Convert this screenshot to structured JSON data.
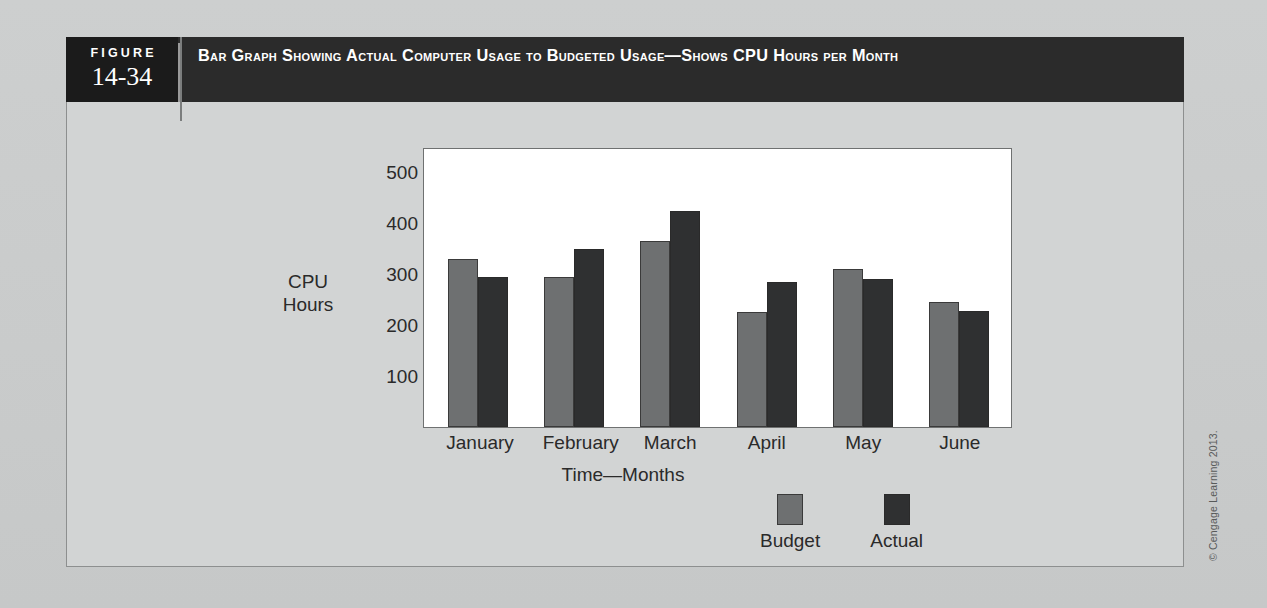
{
  "figure": {
    "number_label": "FIGURE",
    "number_value": "14-34",
    "title": "Bar Graph Showing Actual Computer Usage to Budgeted Usage—Shows CPU Hours per Month"
  },
  "credit": "© Cengage Learning 2013.",
  "colors": {
    "header_bar": "#2b2b2b",
    "number_block": "#1b1b1b",
    "page_background": "#c9cbcb",
    "plot_background": "#ffffff",
    "budget_bar": "#6e7071",
    "actual_bar": "#2f3031"
  },
  "chart_data": {
    "type": "bar",
    "title": "Bar Graph Showing Actual Computer Usage to Budgeted Usage—Shows CPU Hours per Month",
    "categories": [
      "January",
      "February",
      "March",
      "April",
      "May",
      "June"
    ],
    "series": [
      {
        "name": "Budget",
        "values": [
          330,
          295,
          365,
          225,
          310,
          245
        ]
      },
      {
        "name": "Actual",
        "values": [
          295,
          350,
          425,
          285,
          290,
          228
        ]
      }
    ],
    "xlabel": "Time—Months",
    "ylabel": "CPU Hours",
    "ylabel_lines": [
      "CPU",
      "Hours"
    ],
    "ylim": [
      0,
      550
    ],
    "yticks": [
      500,
      400,
      300,
      200,
      100
    ],
    "ytick_labels": [
      "500",
      "400",
      "300",
      "200",
      "100"
    ],
    "grid": false,
    "legend_position": "bottom-right"
  }
}
